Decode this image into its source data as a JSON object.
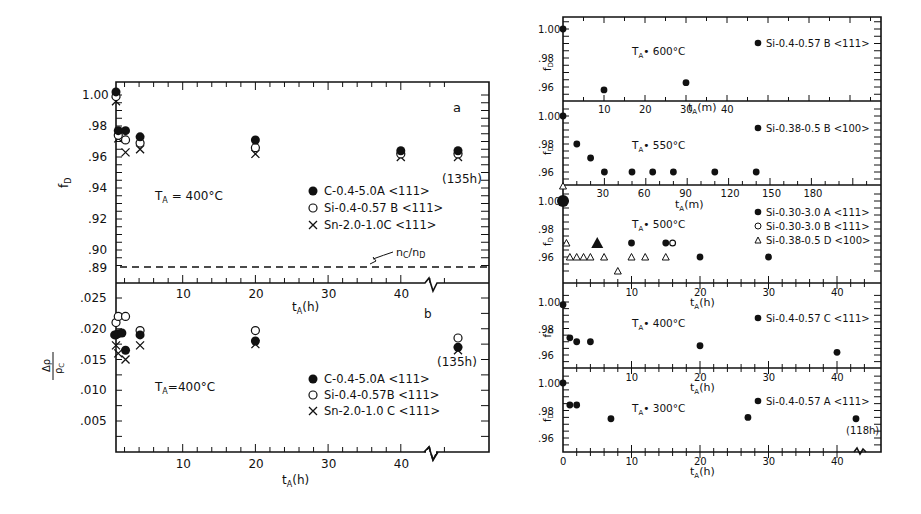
{
  "chart_data": [
    {
      "type": "scatter",
      "panel": "a",
      "title": "",
      "xlabel": "t_A(h)",
      "ylabel": "f_D",
      "xlim": [
        0,
        48
      ],
      "ylim": [
        0.885,
        1.005
      ],
      "x_ticks": [
        "10",
        "20",
        "30",
        "40"
      ],
      "y_ticks": [
        "1.00",
        ".98",
        ".96",
        ".94",
        ".92",
        ".90",
        ".89"
      ],
      "axis_break_x": 43,
      "annotation_temp": "T_A = 400°C",
      "annotation_panel": "a",
      "annotation_last": "(135h)",
      "reference_line": {
        "label": "n_C/n_D",
        "y": 0.89,
        "style": "dashed"
      },
      "series": [
        {
          "name": "C-0.4-5.0A <111>",
          "marker": "filled-circle",
          "x": [
            0,
            1,
            2,
            4,
            20,
            40,
            45
          ],
          "y": [
            1.002,
            0.977,
            0.977,
            0.973,
            0.971,
            0.964,
            0.964
          ]
        },
        {
          "name": "Si-0.4-0.57 B <111>",
          "marker": "open-circle",
          "x": [
            0,
            1,
            2,
            4,
            20,
            40,
            45
          ],
          "y": [
            0.999,
            0.974,
            0.971,
            0.969,
            0.966,
            0.962,
            0.962
          ]
        },
        {
          "name": "Sn-2.0-1.0C <111>",
          "marker": "cross",
          "x": [
            0,
            1,
            2,
            4,
            20,
            40,
            45
          ],
          "y": [
            0.996,
            0.972,
            0.963,
            0.965,
            0.962,
            0.96,
            0.96
          ]
        }
      ],
      "legend_position": "center-right"
    },
    {
      "type": "scatter",
      "panel": "b",
      "xlabel": "t_A(h)",
      "ylabel": "Δρ/ρ_C",
      "xlim": [
        0,
        48
      ],
      "ylim": [
        0,
        0.0275
      ],
      "x_ticks": [
        "10",
        "20",
        "30",
        "40"
      ],
      "y_ticks": [
        ".025",
        ".020",
        ".015",
        ".010",
        ".005"
      ],
      "axis_break_x": 43,
      "annotation_temp": "T_A = 400°C",
      "annotation_panel": "b",
      "annotation_last": "(135h)",
      "series": [
        {
          "name": "C-0.4-5.0A <111>",
          "marker": "filled-circle",
          "x": [
            0,
            0.5,
            1,
            1.5,
            2,
            4,
            20,
            45
          ],
          "y": [
            0.019,
            0.019,
            0.0192,
            0.0193,
            0.0165,
            0.019,
            0.018,
            0.017
          ]
        },
        {
          "name": "Si-0.4-0.57B <111>",
          "marker": "open-circle",
          "x": [
            0,
            1,
            2,
            4,
            20,
            45
          ],
          "y": [
            0.021,
            0.022,
            0.022,
            0.0197,
            0.0197,
            0.0185
          ]
        },
        {
          "name": "Sn-2.0-1.0C <111>",
          "marker": "cross",
          "x": [
            0,
            1,
            2,
            4,
            20,
            45
          ],
          "y": [
            0.0173,
            0.016,
            0.015,
            0.0173,
            0.0175,
            0.0165
          ]
        }
      ],
      "legend_position": "bottom-right"
    },
    {
      "type": "scatter",
      "panel": "600C",
      "xlabel": "t_A(m)",
      "ylabel": "f_D",
      "ylim": [
        0.95,
        1.005
      ],
      "x_ticks": [
        "10",
        "20",
        "30",
        "40"
      ],
      "y_ticks": [
        "1.00",
        ".98",
        ".96"
      ],
      "annotation_temp": "T_A = 600°C",
      "series": [
        {
          "name": "Si-0.4-0.57 B <111>",
          "marker": "filled-circle",
          "x": [
            0,
            10,
            30
          ],
          "y": [
            1.0,
            0.958,
            0.963
          ]
        }
      ]
    },
    {
      "type": "scatter",
      "panel": "550C",
      "xlabel": "t_A(m)",
      "ylabel": "f_D",
      "ylim": [
        0.95,
        1.005
      ],
      "x_ticks": [
        "30",
        "60",
        "90",
        "120",
        "150",
        "180"
      ],
      "y_ticks": [
        "1.00",
        ".98",
        ".96"
      ],
      "annotation_temp": "T_A = 550°C",
      "series": [
        {
          "name": "Si-0.38-0.5B <100>",
          "marker": "filled-circle",
          "x": [
            0,
            10,
            20,
            30,
            50,
            65,
            80,
            110,
            140
          ],
          "y": [
            1.0,
            0.98,
            0.97,
            0.96,
            0.96,
            0.96,
            0.96,
            0.96,
            0.96
          ]
        }
      ]
    },
    {
      "type": "scatter",
      "panel": "500C",
      "xlabel": "t_A(h)",
      "ylabel": "f_D",
      "ylim": [
        0.945,
        1.005
      ],
      "x_ticks": [
        "10",
        "20",
        "30",
        "40"
      ],
      "y_ticks": [
        "1.00",
        ".98",
        ".96"
      ],
      "annotation_temp": "T_A = 500°C",
      "series": [
        {
          "name": "Si-0.30-3.0 A <111>",
          "marker": "filled-circle",
          "x": [
            0,
            10,
            15,
            20,
            30
          ],
          "y": [
            1.0,
            0.97,
            0.97,
            0.96,
            0.96
          ]
        },
        {
          "name": "Si-0.30-3.0B <111>",
          "marker": "open-circle",
          "x": [
            16
          ],
          "y": [
            0.97
          ]
        },
        {
          "name": "Si-0.38-0.5D <100>",
          "marker": "open-triangle",
          "x": [
            0.5,
            1,
            2,
            3,
            4,
            6,
            8,
            10,
            12,
            15
          ],
          "y": [
            0.97,
            0.96,
            0.96,
            0.96,
            0.96,
            0.96,
            0.95,
            0.96,
            0.96,
            0.96
          ]
        },
        {
          "name": "overlap",
          "marker": "filled-triangle",
          "x": [
            5
          ],
          "y": [
            0.97
          ]
        }
      ]
    },
    {
      "type": "scatter",
      "panel": "400C",
      "xlabel": "t_A(h)",
      "ylabel": "f_D",
      "ylim": [
        0.95,
        1.005
      ],
      "x_ticks": [
        "10",
        "20",
        "30",
        "40"
      ],
      "y_ticks": [
        "1.00",
        ".98",
        ".96"
      ],
      "annotation_temp": "T_A = 400°C",
      "series": [
        {
          "name": "Si-0.4-0.57 C <111>",
          "marker": "filled-circle",
          "x": [
            0,
            1,
            2,
            4,
            20,
            40
          ],
          "y": [
            0.998,
            0.973,
            0.97,
            0.97,
            0.967,
            0.962
          ]
        }
      ]
    },
    {
      "type": "scatter",
      "panel": "300C",
      "xlabel": "t_A(h)",
      "ylabel": "f_D",
      "ylim": [
        0.95,
        1.005
      ],
      "x_ticks": [
        "0",
        "10",
        "20",
        "30",
        "40"
      ],
      "y_ticks": [
        "1.00",
        ".98",
        ".96"
      ],
      "annotation_temp": "T_A = 300°C",
      "annotation_last": "(118h)",
      "axis_break_x": 42,
      "series": [
        {
          "name": "Si-0.4-0.57 A<111>",
          "marker": "filled-circle",
          "x": [
            0,
            1,
            2,
            7,
            27,
            43
          ],
          "y": [
            1.0,
            0.984,
            0.984,
            0.974,
            0.975,
            0.974
          ]
        }
      ]
    }
  ],
  "labels": {
    "fd": "f",
    "fd_sub": "D",
    "tA_h": "t",
    "tA_sub": "A",
    "h_unit": "(h)",
    "m_unit": "(m)",
    "panel_a": "a",
    "panel_b": "b",
    "h135": "(135h)",
    "h118": "(118h)",
    "nc_nd": "n",
    "nc_sub": "C",
    "nd_sep": "/n",
    "nd_sub": "D",
    "T400": "T",
    "T_sub": "A",
    "eq400": " = 400°C",
    "eq400b": "=400°C",
    "eq600": "• 600°C",
    "eq550": "• 550°C",
    "eq500": "• 500°C",
    "eq400r": "• 400°C",
    "eq300": "• 300°C",
    "leg_a": [
      "C-0.4-5.0A <111>",
      "Si-0.4-0.57 B <111>",
      "Sn-2.0-1.0C <111>"
    ],
    "leg_b": [
      "C-0.4-5.0A <111>",
      "Si-0.4-0.57B <111>",
      "Sn-2.0-1.0 C <111>"
    ],
    "leg_600": "Si-0.4-0.57 B <111>",
    "leg_550": "Si-0.38-0.5 B <100>",
    "leg_500": [
      "Si-0.30-3.0 A <111>",
      "Si-0.30-3.0 B <111>",
      "Si-0.38-0.5 D <100>"
    ],
    "leg_400": "Si-0.4-0.57 C <111>",
    "leg_300": "Si-0.4-0.57 A <111>",
    "ylab_a": [
      ".98",
      ".96",
      ".94",
      ".92",
      ".90",
      ".89"
    ],
    "ylab_a_top": "1.00",
    "ylab_b": [
      ".025",
      ".020",
      ".015",
      ".010",
      ".005"
    ],
    "xlab_h": [
      "10",
      "20",
      "30",
      "40"
    ],
    "xlab_m600": [
      "10",
      "20",
      "30",
      "40"
    ],
    "xlab_m550": [
      "30",
      "60",
      "90",
      "120",
      "150",
      "180"
    ],
    "ylab_r": [
      "1.00",
      ".98",
      ".96"
    ],
    "zero": "0",
    "drho": "Δρ",
    "rhoc": "ρ",
    "rhoc_sub": "C"
  }
}
